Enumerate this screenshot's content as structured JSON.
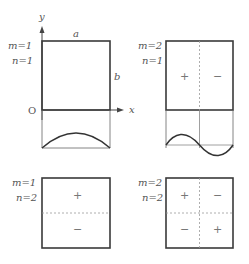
{
  "colors": {
    "box_stroke": "#3a3a3a",
    "thin_stroke": "#666666",
    "dashed_stroke": "#999999",
    "text": "#555555"
  },
  "axes": {
    "x_label": "x",
    "y_label": "y",
    "origin_label": "O",
    "width_label": "a",
    "height_label": "b"
  },
  "modes": [
    {
      "id": "m1n1",
      "m_label": "m=1",
      "n_label": "n=1",
      "signs": [],
      "has_profile": true,
      "profile": "half-sine arch"
    },
    {
      "id": "m2n1",
      "m_label": "m=2",
      "n_label": "n=1",
      "signs": [
        "+",
        "−"
      ],
      "has_profile": true,
      "profile": "full sine wave"
    },
    {
      "id": "m1n2",
      "m_label": "m=1",
      "n_label": "n=2",
      "signs": [
        "+",
        "−"
      ],
      "has_profile": false
    },
    {
      "id": "m2n2",
      "m_label": "m=2",
      "n_label": "n=2",
      "signs": [
        "+",
        "−",
        "−",
        "+"
      ],
      "has_profile": false
    }
  ]
}
